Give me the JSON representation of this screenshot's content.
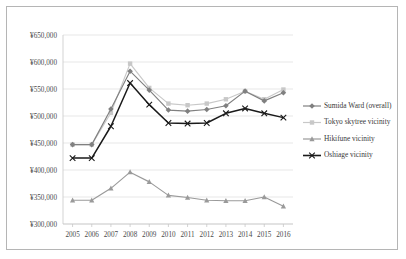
{
  "chart_data": {
    "type": "line",
    "title": "",
    "xlabel": "",
    "ylabel": "",
    "categories": [
      "2005",
      "2006",
      "2007",
      "2008",
      "2009",
      "2010",
      "2011",
      "2012",
      "2013",
      "2014",
      "2015",
      "2016"
    ],
    "ylim": [
      300000,
      650000
    ],
    "ytick_labels": [
      "¥650,000",
      "¥600,000",
      "¥550,000",
      "¥500,000",
      "¥450,000",
      "¥400,000",
      "¥350,000",
      "¥300,000"
    ],
    "ytick_values": [
      650000,
      600000,
      550000,
      500000,
      450000,
      400000,
      350000,
      300000
    ],
    "grid": "horizontal",
    "legend_position": "right",
    "series": [
      {
        "name": "Sumida Ward (overall)",
        "color": "#808080",
        "marker": "diamond",
        "values": [
          447000,
          447000,
          513000,
          583000,
          548000,
          511000,
          509000,
          512000,
          519000,
          546000,
          528000,
          543000
        ]
      },
      {
        "name": "Tokyo skytree vicinity",
        "color": "#c8c8c8",
        "marker": "square",
        "values": [
          447000,
          447000,
          506000,
          597000,
          552000,
          523000,
          520000,
          523000,
          531000,
          546000,
          531000,
          549000
        ]
      },
      {
        "name": "Hikifune vicinity",
        "color": "#9a9a9a",
        "marker": "triangle",
        "values": [
          344000,
          344000,
          366000,
          396000,
          378000,
          353000,
          349000,
          344000,
          343000,
          343000,
          350000,
          333000
        ]
      },
      {
        "name": "Oshiage vicinity",
        "color": "#1a1a1a",
        "marker": "cross",
        "values": [
          422000,
          422000,
          481000,
          561000,
          521000,
          487000,
          486000,
          487000,
          505000,
          514000,
          505000,
          497000
        ]
      }
    ]
  },
  "legend": {
    "items": [
      {
        "label": "Sumida Ward (overall)"
      },
      {
        "label": "Tokyo skytree vicinity"
      },
      {
        "label": "Hikifune vicinity"
      },
      {
        "label": "Oshiage vicinity"
      }
    ]
  }
}
